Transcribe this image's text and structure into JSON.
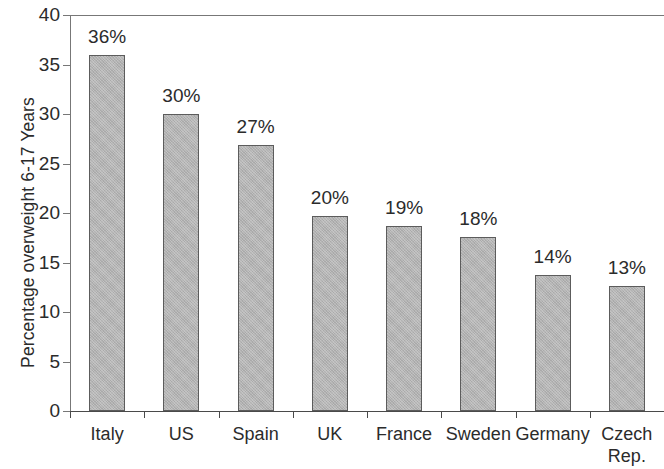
{
  "chart_data": {
    "type": "bar",
    "title": "",
    "xlabel": "",
    "ylabel": "Percentage overweight 6-17 Years",
    "categories": [
      "Italy",
      "US",
      "Spain",
      "UK",
      "France",
      "Sweden",
      "Germany",
      "Czech Rep."
    ],
    "values": [
      36,
      30,
      27,
      20,
      19,
      18,
      14,
      13
    ],
    "plotted_values": [
      36.0,
      30.0,
      26.9,
      19.7,
      18.7,
      17.6,
      13.7,
      12.6
    ],
    "data_labels": [
      "36%",
      "30%",
      "27%",
      "20%",
      "19%",
      "18%",
      "14%",
      "13%"
    ],
    "ylim": [
      0,
      40
    ],
    "ytick_values": [
      0,
      5,
      10,
      15,
      20,
      25,
      30,
      35,
      40
    ],
    "ytick_labels": [
      "0",
      "5",
      "10",
      "15",
      "20",
      "25",
      "30",
      "35",
      "40"
    ],
    "grid": false,
    "legend": null,
    "legend_position": "none",
    "colors": {
      "bar_fill": "#b3b3b3",
      "bar_border": "#5c5c5c",
      "axis": "#4a4a4a",
      "text": "#2b2b2b",
      "background": "#ffffff"
    }
  }
}
